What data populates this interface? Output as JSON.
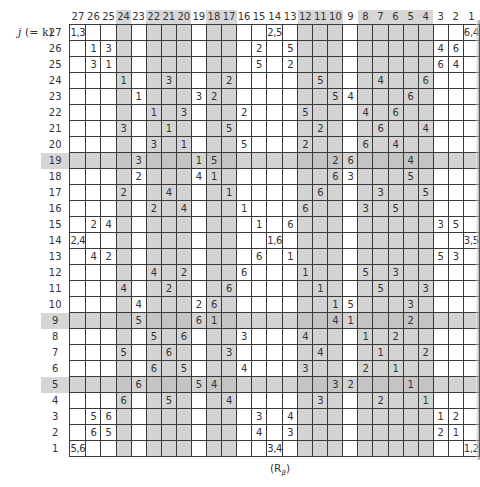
{
  "figure": {
    "row_axis_label": "j (= k)",
    "row_axis_label_var": "j",
    "row_axis_label_rest": "(= k)",
    "bottom_label": "(R",
    "bottom_label_sub": "β",
    "bottom_label_close": ")"
  },
  "columns": [
    27,
    26,
    25,
    24,
    23,
    22,
    21,
    20,
    19,
    18,
    17,
    16,
    15,
    14,
    13,
    12,
    11,
    10,
    9,
    8,
    7,
    6,
    5,
    4,
    3,
    2,
    1
  ],
  "shaded_columns": [
    24,
    22,
    21,
    20,
    18,
    17,
    12,
    11,
    10,
    8,
    7,
    6,
    5,
    4
  ],
  "shaded_rows": [
    19,
    9,
    5
  ],
  "rows": [
    {
      "j": 27,
      "cells": {
        "27": "1,3",
        "14": "2,5",
        "1": "6,4"
      }
    },
    {
      "j": 26,
      "cells": {
        "26": "1",
        "25": "3",
        "15": "2",
        "13": "5",
        "3": "4",
        "2": "6"
      }
    },
    {
      "j": 25,
      "cells": {
        "26": "3",
        "25": "1",
        "15": "5",
        "13": "2",
        "3": "6",
        "2": "4"
      }
    },
    {
      "j": 24,
      "cells": {
        "24": "1",
        "21": "3",
        "17": "2",
        "11": "5",
        "7": "4",
        "4": "6"
      }
    },
    {
      "j": 23,
      "cells": {
        "23": "1",
        "19": "3",
        "18": "2",
        "10": "5",
        "9": "4",
        "5": "6"
      }
    },
    {
      "j": 22,
      "cells": {
        "22": "1",
        "20": "3",
        "16": "2",
        "12": "5",
        "8": "4",
        "6": "6"
      }
    },
    {
      "j": 21,
      "cells": {
        "24": "3",
        "21": "1",
        "17": "5",
        "11": "2",
        "7": "6",
        "4": "4"
      }
    },
    {
      "j": 20,
      "cells": {
        "22": "3",
        "20": "1",
        "16": "5",
        "12": "2",
        "8": "6",
        "6": "4"
      }
    },
    {
      "j": 19,
      "cells": {
        "23": "3",
        "19": "1",
        "18": "5",
        "10": "2",
        "9": "6",
        "5": "4"
      }
    },
    {
      "j": 18,
      "cells": {
        "23": "2",
        "19": "4",
        "18": "1",
        "10": "6",
        "9": "3",
        "5": "5"
      }
    },
    {
      "j": 17,
      "cells": {
        "24": "2",
        "21": "4",
        "17": "1",
        "11": "6",
        "7": "3",
        "4": "5"
      }
    },
    {
      "j": 16,
      "cells": {
        "22": "2",
        "20": "4",
        "16": "1",
        "12": "6",
        "8": "3",
        "6": "5"
      }
    },
    {
      "j": 15,
      "cells": {
        "26": "2",
        "25": "4",
        "15": "1",
        "13": "6",
        "3": "3",
        "2": "5"
      }
    },
    {
      "j": 14,
      "cells": {
        "27": "2,4",
        "14": "1,6",
        "1": "3,5"
      }
    },
    {
      "j": 13,
      "cells": {
        "26": "4",
        "25": "2",
        "15": "6",
        "13": "1",
        "3": "5",
        "2": "3"
      }
    },
    {
      "j": 12,
      "cells": {
        "22": "4",
        "20": "2",
        "16": "6",
        "12": "1",
        "8": "5",
        "6": "3"
      }
    },
    {
      "j": 11,
      "cells": {
        "24": "4",
        "21": "2",
        "17": "6",
        "11": "1",
        "7": "5",
        "4": "3"
      }
    },
    {
      "j": 10,
      "cells": {
        "23": "4",
        "19": "2",
        "18": "6",
        "10": "1",
        "9": "5",
        "5": "3"
      }
    },
    {
      "j": 9,
      "cells": {
        "23": "5",
        "19": "6",
        "18": "1",
        "10": "4",
        "9": "1",
        "5": "2"
      }
    },
    {
      "j": 8,
      "cells": {
        "22": "5",
        "20": "6",
        "16": "3",
        "12": "4",
        "8": "1",
        "6": "2"
      }
    },
    {
      "j": 7,
      "cells": {
        "24": "5",
        "21": "6",
        "17": "3",
        "11": "4",
        "7": "1",
        "4": "2"
      }
    },
    {
      "j": 6,
      "cells": {
        "22": "6",
        "20": "5",
        "16": "4",
        "12": "3",
        "8": "2",
        "6": "1"
      }
    },
    {
      "j": 5,
      "cells": {
        "23": "6",
        "19": "5",
        "18": "4",
        "10": "3",
        "9": "2",
        "5": "1"
      }
    },
    {
      "j": 4,
      "cells": {
        "24": "6",
        "21": "5",
        "17": "4",
        "11": "3",
        "7": "2",
        "4": "1"
      }
    },
    {
      "j": 3,
      "cells": {
        "26": "5",
        "25": "6",
        "15": "3",
        "13": "4",
        "3": "1",
        "2": "2"
      }
    },
    {
      "j": 2,
      "cells": {
        "26": "6",
        "25": "5",
        "15": "4",
        "13": "3",
        "3": "2",
        "2": "1"
      }
    },
    {
      "j": 1,
      "cells": {
        "27": "5,6",
        "14": "3,4",
        "1": "1,2"
      }
    }
  ]
}
